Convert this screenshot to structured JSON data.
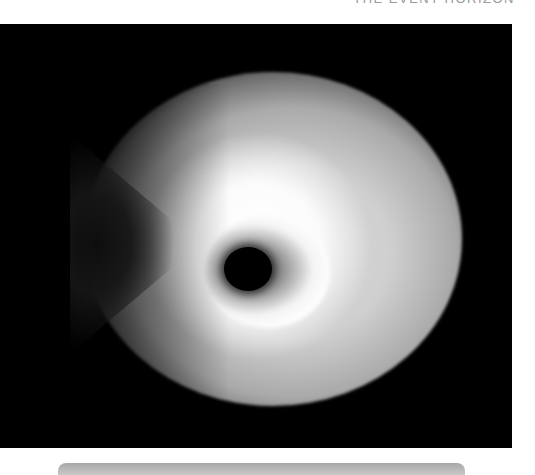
{
  "caption": {
    "text": "THE EVENT HORIZON",
    "clipped": true
  },
  "image": {
    "subject": "black-hole-accretion-render",
    "background_color": "#000000",
    "glow_color": "#ffffff",
    "shadow_color": "#000000"
  },
  "bottom_bar": {
    "color": "#b4b4b4"
  }
}
